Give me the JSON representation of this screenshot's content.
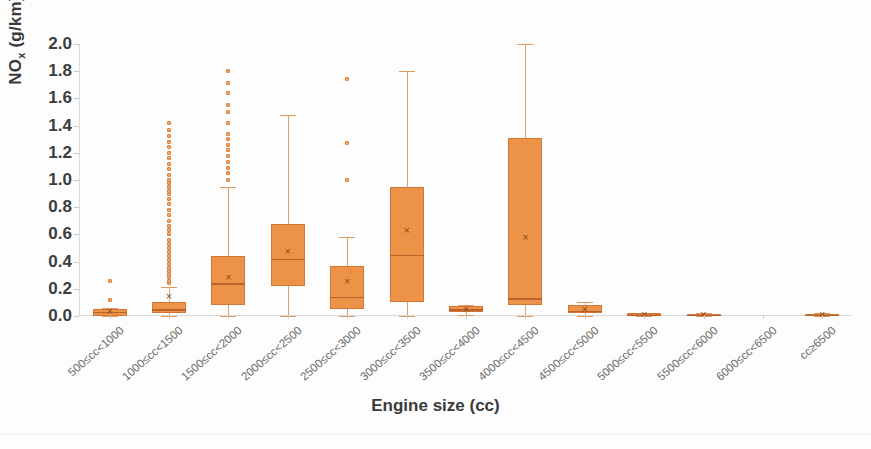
{
  "chart_data": {
    "type": "box",
    "title": "",
    "xlabel": "Engine size (cc)",
    "ylabel": "NOx (g/km)",
    "ylabel_main": "NO",
    "ylabel_sub": "x",
    "ylabel_units": " (g/km)",
    "ylim": [
      0.0,
      2.0
    ],
    "ytick_labels": [
      "0.0",
      "0.2",
      "0.4",
      "0.6",
      "0.8",
      "1.0",
      "1.2",
      "1.4",
      "1.6",
      "1.8",
      "2.0"
    ],
    "ytick_values": [
      0.0,
      0.2,
      0.4,
      0.6,
      0.8,
      1.0,
      1.2,
      1.4,
      1.6,
      1.8,
      2.0
    ],
    "grid": false,
    "legend": "none",
    "accent_color": "#ed9348",
    "box_edge_color": "#d4763a",
    "median_color": "#b8622c",
    "whisker_color": "#e0a06a",
    "categories": [
      "500≤cc<1000",
      "1000≤cc<1500",
      "1500≤cc<2000",
      "2000≤cc<2500",
      "2500≤cc<3000",
      "3000≤cc<3500",
      "3500≤cc<4000",
      "4000≤cc<4500",
      "4500≤cc<5000",
      "5000≤cc<5500",
      "5500≤cc<6000",
      "6000≤cc<6500",
      "cc≥6500"
    ],
    "boxes": [
      {
        "category": "500≤cc<1000",
        "whisker_low": 0.0,
        "q1": 0.0,
        "median": 0.03,
        "q3": 0.05,
        "whisker_high": 0.06,
        "mean": 0.035,
        "outliers": [
          0.12,
          0.26
        ]
      },
      {
        "category": "1000≤cc<1500",
        "whisker_low": 0.0,
        "q1": 0.02,
        "median": 0.05,
        "q3": 0.1,
        "whisker_high": 0.21,
        "mean": 0.15,
        "outliers": [
          0.24,
          0.26,
          0.29,
          0.31,
          0.33,
          0.35,
          0.38,
          0.41,
          0.44,
          0.47,
          0.5,
          0.53,
          0.56,
          0.6,
          0.63,
          0.66,
          0.7,
          0.74,
          0.78,
          0.82,
          0.86,
          0.9,
          0.92,
          0.95,
          0.98,
          1.0,
          1.04,
          1.08,
          1.12,
          1.16,
          1.2,
          1.24,
          1.28,
          1.32,
          1.37,
          1.42
        ]
      },
      {
        "category": "1500≤cc<2000",
        "whisker_low": 0.0,
        "q1": 0.08,
        "median": 0.24,
        "q3": 0.44,
        "whisker_high": 0.95,
        "mean": 0.29,
        "outliers": [
          1.0,
          1.05,
          1.09,
          1.13,
          1.18,
          1.22,
          1.26,
          1.3,
          1.34,
          1.42,
          1.5,
          1.55,
          1.64,
          1.71,
          1.8
        ]
      },
      {
        "category": "2000≤cc<2500",
        "whisker_low": 0.0,
        "q1": 0.22,
        "median": 0.42,
        "q3": 0.68,
        "whisker_high": 1.48,
        "mean": 0.48,
        "outliers": []
      },
      {
        "category": "2500≤cc<3000",
        "whisker_low": 0.0,
        "q1": 0.05,
        "median": 0.14,
        "q3": 0.37,
        "whisker_high": 0.58,
        "mean": 0.26,
        "outliers": [
          1.0,
          1.27,
          1.74
        ]
      },
      {
        "category": "3000≤cc<3500",
        "whisker_low": 0.0,
        "q1": 0.1,
        "median": 0.45,
        "q3": 0.95,
        "whisker_high": 1.8,
        "mean": 0.63,
        "outliers": []
      },
      {
        "category": "3500≤cc<4000",
        "whisker_low": 0.01,
        "q1": 0.03,
        "median": 0.05,
        "q3": 0.07,
        "whisker_high": 0.08,
        "mean": 0.05,
        "outliers": []
      },
      {
        "category": "4000≤cc<4500",
        "whisker_low": 0.0,
        "q1": 0.08,
        "median": 0.13,
        "q3": 1.31,
        "whisker_high": 2.0,
        "mean": 0.58,
        "outliers": []
      },
      {
        "category": "4500≤cc<5000",
        "whisker_low": 0.0,
        "q1": 0.02,
        "median": 0.04,
        "q3": 0.08,
        "whisker_high": 0.1,
        "mean": 0.055,
        "outliers": []
      },
      {
        "category": "5000≤cc<5500",
        "whisker_low": 0.0,
        "q1": 0.005,
        "median": 0.01,
        "q3": 0.02,
        "whisker_high": 0.025,
        "mean": 0.014,
        "outliers": []
      },
      {
        "category": "5500≤cc<6000",
        "whisker_low": 0.0,
        "q1": 0.005,
        "median": 0.01,
        "q3": 0.015,
        "whisker_high": 0.02,
        "mean": 0.012,
        "outliers": []
      },
      {
        "category": "6000≤cc<6500",
        "whisker_low": null,
        "q1": null,
        "median": null,
        "q3": null,
        "whisker_high": null,
        "mean": null,
        "outliers": []
      },
      {
        "category": "cc≥6500",
        "whisker_low": 0.0,
        "q1": 0.005,
        "median": 0.01,
        "q3": 0.015,
        "whisker_high": 0.02,
        "mean": 0.012,
        "outliers": []
      }
    ]
  }
}
